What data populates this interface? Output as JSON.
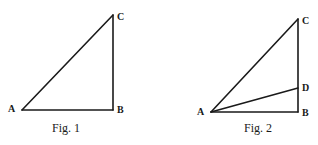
{
  "figures": [
    {
      "caption": "Fig. 1",
      "vertices": {
        "A": {
          "label": "A",
          "x": 22,
          "y": 110
        },
        "B": {
          "label": "B",
          "x": 113,
          "y": 110
        },
        "C": {
          "label": "C",
          "x": 113,
          "y": 15
        }
      },
      "segments": [
        "AB",
        "BC",
        "CA"
      ]
    },
    {
      "caption": "Fig. 2",
      "vertices": {
        "A": {
          "label": "A",
          "x": 211,
          "y": 112
        },
        "B": {
          "label": "B",
          "x": 298,
          "y": 112
        },
        "C": {
          "label": "C",
          "x": 298,
          "y": 19
        },
        "D": {
          "label": "D",
          "x": 298,
          "y": 88
        }
      },
      "segments": [
        "AB",
        "BC",
        "CA",
        "AD"
      ]
    }
  ]
}
